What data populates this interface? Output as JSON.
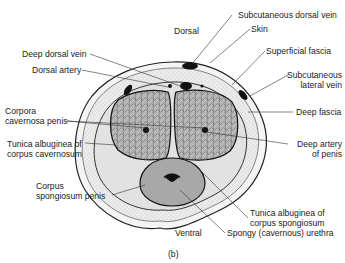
{
  "figure": {
    "panel_label": "(b)",
    "orientation": {
      "top": "Dorsal",
      "bottom": "Ventral"
    },
    "labels": {
      "subcutaneous_dorsal_vein": "Subcutaneous dorsal vein",
      "skin": "Skin",
      "superficial_fascia": "Superficial fascia",
      "subcutaneous_lateral_vein_1": "Subcutaneous",
      "subcutaneous_lateral_vein_2": "lateral vein",
      "deep_fascia": "Deep fascia",
      "deep_artery_1": "Deep artery",
      "deep_artery_2": "of penis",
      "tunica_spongiosum_1": "Tunica albuginea of",
      "tunica_spongiosum_2": "corpus spongiosum",
      "spongy_urethra": "Spongy (cavernous) urethra",
      "deep_dorsal_vein": "Deep dorsal vein",
      "dorsal_artery": "Dorsal artery",
      "corpora_cavernosa_1": "Corpora",
      "corpora_cavernosa_2": "cavernosa penis",
      "tunica_cavernosum_1": "Tunica albuginea of",
      "tunica_cavernosum_2": "corpus cavernosum",
      "corpus_spongiosum_1": "Corpus",
      "corpus_spongiosum_2": "spongiosum penis"
    }
  }
}
